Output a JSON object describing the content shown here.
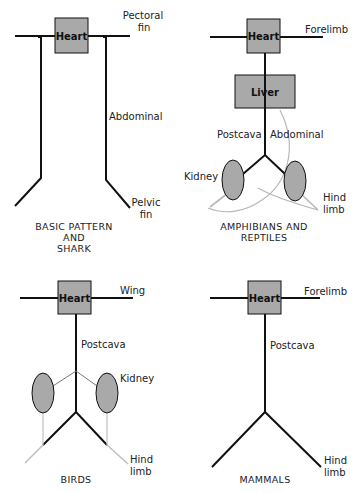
{
  "diagram": {
    "colors": {
      "line": "#111111",
      "box_fill": "#a9a9a9",
      "thin_line": "#b8b8b8"
    },
    "panels": [
      {
        "id": "basic",
        "title_lines": [
          "BASIC PATTERN",
          "AND",
          "SHARK"
        ],
        "heart_label": "Heart",
        "labels": {
          "fore": [
            "Pectoral",
            "fin"
          ],
          "abdominal": "Abdominal",
          "hind": [
            "Pelvic",
            "fin"
          ]
        }
      },
      {
        "id": "amphibians",
        "title_lines": [
          "AMPHIBIANS AND",
          "REPTILES"
        ],
        "heart_label": "Heart",
        "liver_label": "Liver",
        "labels": {
          "fore": "Forelimb",
          "postcava": "Postcava",
          "abdominal": "Abdominal",
          "kidney": "Kidney",
          "hind": [
            "Hind",
            "limb"
          ]
        }
      },
      {
        "id": "birds",
        "title_lines": [
          "BIRDS"
        ],
        "heart_label": "Heart",
        "labels": {
          "fore": "Wing",
          "postcava": "Postcava",
          "kidney": "Kidney",
          "hind": [
            "Hind",
            "limb"
          ]
        }
      },
      {
        "id": "mammals",
        "title_lines": [
          "MAMMALS"
        ],
        "heart_label": "Heart",
        "labels": {
          "fore": "Forelimb",
          "postcava": "Postcava",
          "hind": [
            "Hind",
            "limb"
          ]
        }
      }
    ]
  }
}
